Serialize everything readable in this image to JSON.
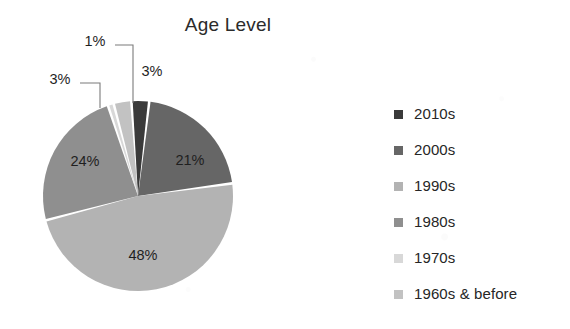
{
  "chart_data": {
    "type": "pie",
    "title": "Age Level",
    "categories": [
      "2010s",
      "2000s",
      "1990s",
      "1980s",
      "1970s",
      "1960s & before"
    ],
    "values": [
      3,
      21,
      48,
      24,
      1,
      3
    ],
    "value_labels": [
      "3%",
      "21%",
      "48%",
      "24%",
      "1%",
      "3%"
    ],
    "colors": [
      "#3a3a3a",
      "#666666",
      "#b3b3b3",
      "#8f8f8f",
      "#d8d8d8",
      "#c2c2c2"
    ],
    "start_angle_deg": -4,
    "gap_deg": 1.6,
    "legend_position": "right",
    "grid": false,
    "xlabel": "",
    "ylabel": ""
  },
  "chart": {
    "title": "Age Level",
    "slices": [
      {
        "name": "2010s",
        "label": "3%",
        "color": "#3a3a3a",
        "value": 3,
        "label_mode": "callout",
        "label_x": 152,
        "label_y": 72,
        "leader": ""
      },
      {
        "name": "2000s",
        "label": "21%",
        "color": "#666666",
        "value": 21,
        "label_mode": "inside",
        "label_x": 190,
        "label_y": 161,
        "leader": ""
      },
      {
        "name": "1990s",
        "label": "48%",
        "color": "#b3b3b3",
        "value": 48,
        "label_mode": "inside",
        "label_x": 143,
        "label_y": 256,
        "leader": ""
      },
      {
        "name": "1980s",
        "label": "24%",
        "color": "#8f8f8f",
        "value": 24,
        "label_mode": "inside",
        "label_x": 85,
        "label_y": 162,
        "leader": ""
      },
      {
        "name": "1970s",
        "label": "1%",
        "color": "#d8d8d8",
        "value": 1,
        "label_mode": "callout",
        "label_x": 95,
        "label_y": 42,
        "leader": "M 115 45 L 133 45 L 133 103"
      },
      {
        "name": "1960s & before",
        "label": "3%",
        "color": "#c2c2c2",
        "value": 3,
        "label_mode": "callout",
        "label_x": 60,
        "label_y": 80,
        "leader": "M 80 83 L 100 83 L 100 108"
      }
    ]
  },
  "legend": {
    "items": [
      {
        "label": "2010s",
        "color": "#3a3a3a"
      },
      {
        "label": "2000s",
        "color": "#666666"
      },
      {
        "label": "1990s",
        "color": "#b3b3b3"
      },
      {
        "label": "1980s",
        "color": "#8f8f8f"
      },
      {
        "label": "1970s",
        "color": "#d8d8d8"
      },
      {
        "label": "1960s & before",
        "color": "#c2c2c2"
      }
    ]
  },
  "geometry": {
    "cx": 138,
    "cy": 196,
    "r": 95
  }
}
